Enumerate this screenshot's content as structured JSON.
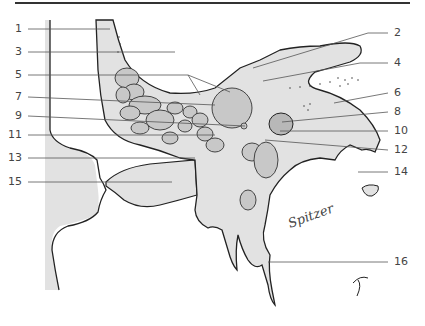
{
  "figure": {
    "type": "anatomical line drawing (sagittal section)",
    "fill_color": "#e2e2e2",
    "dark_fill_color": "#c8c8c8",
    "outline_color": "#222222",
    "leader_color": "#555555",
    "signature": "Spitzer"
  },
  "labels": {
    "left": [
      {
        "n": "1",
        "y": 29
      },
      {
        "n": "3",
        "y": 52
      },
      {
        "n": "5",
        "y": 75
      },
      {
        "n": "7",
        "y": 97
      },
      {
        "n": "9",
        "y": 116
      },
      {
        "n": "11",
        "y": 135
      },
      {
        "n": "13",
        "y": 158
      },
      {
        "n": "15",
        "y": 182
      }
    ],
    "right": [
      {
        "n": "2",
        "y": 33
      },
      {
        "n": "4",
        "y": 63
      },
      {
        "n": "6",
        "y": 93
      },
      {
        "n": "8",
        "y": 112
      },
      {
        "n": "10",
        "y": 131
      },
      {
        "n": "12",
        "y": 150
      },
      {
        "n": "14",
        "y": 172
      },
      {
        "n": "16",
        "y": 262
      }
    ]
  }
}
